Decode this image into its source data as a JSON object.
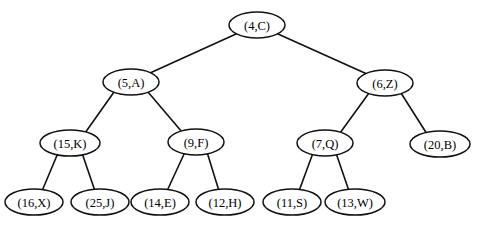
{
  "diagram": {
    "kind": "binary-tree",
    "title": "",
    "background_color": "#ffffff",
    "stroke_color": "#111111",
    "text_color": "#000000",
    "nodes": [
      {
        "id": "n0",
        "label": "(4,C)",
        "key": 4,
        "value": "C",
        "cx": 257,
        "cy": 25,
        "rx": 28,
        "ry": 13,
        "level": 0
      },
      {
        "id": "n1",
        "label": "(5,A)",
        "key": 5,
        "value": "A",
        "cx": 131,
        "cy": 82,
        "rx": 28,
        "ry": 13,
        "level": 1
      },
      {
        "id": "n2",
        "label": "(6,Z)",
        "key": 6,
        "value": "Z",
        "cx": 385,
        "cy": 83,
        "rx": 28,
        "ry": 13,
        "level": 1
      },
      {
        "id": "n3",
        "label": "(15,K)",
        "key": 15,
        "value": "K",
        "cx": 70,
        "cy": 143,
        "rx": 30,
        "ry": 13,
        "level": 2
      },
      {
        "id": "n4",
        "label": "(9,F)",
        "key": 9,
        "value": "F",
        "cx": 196,
        "cy": 142,
        "rx": 28,
        "ry": 13,
        "level": 2
      },
      {
        "id": "n5",
        "label": "(7,Q)",
        "key": 7,
        "value": "Q",
        "cx": 325,
        "cy": 143,
        "rx": 28,
        "ry": 13,
        "level": 2
      },
      {
        "id": "n6",
        "label": "(20,B)",
        "key": 20,
        "value": "B",
        "cx": 440,
        "cy": 144,
        "rx": 30,
        "ry": 13,
        "level": 2
      },
      {
        "id": "n7",
        "label": "(16,X)",
        "key": 16,
        "value": "X",
        "cx": 34,
        "cy": 202,
        "rx": 29,
        "ry": 13,
        "level": 3
      },
      {
        "id": "n8",
        "label": "(25,J)",
        "key": 25,
        "value": "J",
        "cx": 100,
        "cy": 202,
        "rx": 29,
        "ry": 13,
        "level": 3
      },
      {
        "id": "n9",
        "label": "(14,E)",
        "key": 14,
        "value": "E",
        "cx": 160,
        "cy": 202,
        "rx": 29,
        "ry": 13,
        "level": 3
      },
      {
        "id": "n10",
        "label": "(12,H)",
        "key": 12,
        "value": "H",
        "cx": 225,
        "cy": 202,
        "rx": 29,
        "ry": 13,
        "level": 3
      },
      {
        "id": "n11",
        "label": "(11,S)",
        "key": 11,
        "value": "S",
        "cx": 292,
        "cy": 202,
        "rx": 29,
        "ry": 13,
        "level": 3
      },
      {
        "id": "n12",
        "label": "(13,W)",
        "key": 13,
        "value": "W",
        "cx": 355,
        "cy": 202,
        "rx": 30,
        "ry": 13,
        "level": 3
      }
    ],
    "edges": [
      {
        "from": "n0",
        "to": "n1",
        "x1": 236,
        "y1": 34,
        "x2": 150,
        "y2": 73
      },
      {
        "from": "n0",
        "to": "n2",
        "x1": 278,
        "y1": 34,
        "x2": 367,
        "y2": 74
      },
      {
        "from": "n1",
        "to": "n3",
        "x1": 114,
        "y1": 92,
        "x2": 85,
        "y2": 133
      },
      {
        "from": "n1",
        "to": "n4",
        "x1": 148,
        "y1": 92,
        "x2": 182,
        "y2": 132
      },
      {
        "from": "n2",
        "to": "n5",
        "x1": 369,
        "y1": 93,
        "x2": 340,
        "y2": 133
      },
      {
        "from": "n2",
        "to": "n6",
        "x1": 401,
        "y1": 93,
        "x2": 427,
        "y2": 134
      },
      {
        "from": "n3",
        "to": "n7",
        "x1": 58,
        "y1": 153,
        "x2": 42,
        "y2": 191
      },
      {
        "from": "n3",
        "to": "n8",
        "x1": 82,
        "y1": 153,
        "x2": 95,
        "y2": 191
      },
      {
        "from": "n4",
        "to": "n9",
        "x1": 185,
        "y1": 152,
        "x2": 167,
        "y2": 191
      },
      {
        "from": "n4",
        "to": "n10",
        "x1": 207,
        "y1": 152,
        "x2": 219,
        "y2": 191
      },
      {
        "from": "n5",
        "to": "n11",
        "x1": 313,
        "y1": 153,
        "x2": 299,
        "y2": 191
      },
      {
        "from": "n5",
        "to": "n12",
        "x1": 336,
        "y1": 153,
        "x2": 349,
        "y2": 191
      }
    ]
  }
}
